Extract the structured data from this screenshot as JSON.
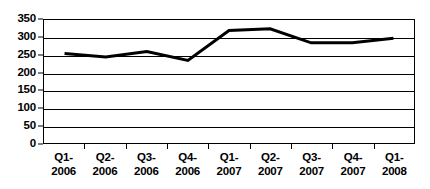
{
  "chart_data": {
    "type": "line",
    "title": "",
    "subtitle": "",
    "xlabel": "",
    "ylabel": "",
    "categories": [
      "Q1-2006",
      "Q2-2006",
      "Q3-2006",
      "Q4-2006",
      "Q1-2007",
      "Q2-2007",
      "Q3-2007",
      "Q4-2007",
      "Q1-2008"
    ],
    "category_lines": [
      [
        "Q1-",
        "2006"
      ],
      [
        "Q2-",
        "2006"
      ],
      [
        "Q3-",
        "2006"
      ],
      [
        "Q4-",
        "2006"
      ],
      [
        "Q1-",
        "2007"
      ],
      [
        "Q2-",
        "2007"
      ],
      [
        "Q3-",
        "2007"
      ],
      [
        "Q4-",
        "2007"
      ],
      [
        "Q1-",
        "2008"
      ]
    ],
    "values": [
      255,
      245,
      260,
      235,
      320,
      325,
      285,
      285,
      298
    ],
    "ylim": [
      0,
      350
    ],
    "yticks": [
      0,
      50,
      100,
      150,
      200,
      250,
      300,
      350
    ],
    "ytick_labels": [
      "0",
      "50",
      "100",
      "150",
      "200",
      "250",
      "300",
      "350"
    ],
    "grid": "horizontal",
    "legend": "none",
    "series_color": "#000000",
    "axis_color": "#000000",
    "background_color": "#ffffff",
    "line_width": 3
  }
}
